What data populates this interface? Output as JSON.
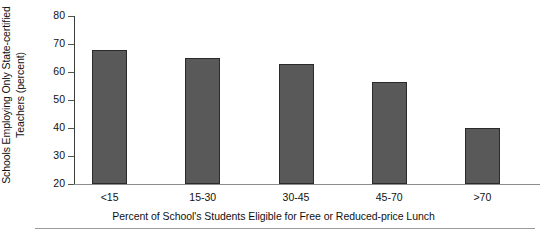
{
  "chart_data": {
    "type": "bar",
    "title": "",
    "categories": [
      "<15",
      "15-30",
      "30-45",
      "45-70",
      ">70"
    ],
    "values": [
      68,
      65,
      63,
      56.5,
      40
    ],
    "series": [
      {
        "name": "Schools Employing Only State-certified Teachers",
        "values": [
          68,
          65,
          63,
          56.5,
          40
        ]
      }
    ],
    "xlabel": "Percent of School's Students Eligible for Free or Reduced-price Lunch",
    "ylabel": "Schools Employing Only State-certified Teachers (percent)",
    "ylabel_lines": [
      "Schools Employing Only State-certified",
      "Teachers (percent)"
    ],
    "ylim": [
      20,
      80
    ],
    "yticks": [
      20,
      30,
      40,
      50,
      60,
      70,
      80
    ],
    "ytick_labels": [
      "20",
      "30",
      "40",
      "50",
      "60",
      "70",
      "80"
    ],
    "xtick_labels": [
      "<15",
      "15-30",
      "30-45",
      "45-70",
      ">70"
    ],
    "grid": false,
    "legend": "none",
    "bar_color": "#595959",
    "bar_edge_color": "#2b2b2b",
    "axis_color": "#3d3d3d"
  }
}
